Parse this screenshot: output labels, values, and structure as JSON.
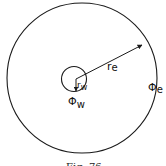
{
  "figure": {
    "caption": "Fig. 76",
    "labels": {
      "outer_radius": "r",
      "outer_radius_sub": "e",
      "inner_radius": "r",
      "inner_radius_sub": "w",
      "outer_potential": "Φ",
      "outer_potential_sub": "e",
      "inner_potential": "Φ",
      "inner_potential_sub": "w"
    },
    "colors": {
      "stroke": "#1a1a1a",
      "background": "#ffffff"
    }
  }
}
